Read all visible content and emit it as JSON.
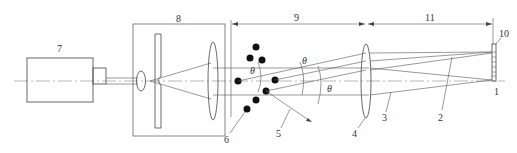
{
  "diagram": {
    "type": "optical-schematic",
    "labels": {
      "l1": "1",
      "l2": "2",
      "l3": "3",
      "l4": "4",
      "l5": "5",
      "l6": "6",
      "l7": "7",
      "l8": "8",
      "l9": "9",
      "l10": "10",
      "l11": "11"
    },
    "angle_symbol": "θ",
    "components": [
      {
        "id": "7",
        "name": "laser"
      },
      {
        "id": "8",
        "name": "beam expander / spatial filter"
      },
      {
        "id": "6",
        "name": "particles"
      },
      {
        "id": "5",
        "name": "scattered light"
      },
      {
        "id": "4",
        "name": "fourier lens"
      },
      {
        "id": "3",
        "name": "scattered ray"
      },
      {
        "id": "2",
        "name": "unscattered ray"
      },
      {
        "id": "10",
        "name": "detector"
      },
      {
        "id": "1",
        "name": "focal point"
      },
      {
        "id": "9",
        "name": "working distance"
      },
      {
        "id": "11",
        "name": "focal length"
      }
    ]
  }
}
